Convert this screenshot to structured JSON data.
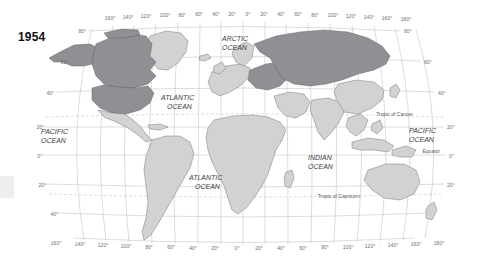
{
  "map": {
    "year": "1954",
    "projection": "robinson-world",
    "background_color": "#ffffff",
    "land_color": "#d2d2d2",
    "highlight_color": "#8f9094",
    "border_color": "#6e6e72",
    "graticule_color": "#b9b9bd",
    "longitude_ticks_top": [
      "160°",
      "140°",
      "120°",
      "100°",
      "80°",
      "60°",
      "40°",
      "20°",
      "0°",
      "20°",
      "40°",
      "60°",
      "80°",
      "100°",
      "120°",
      "140°",
      "160°",
      "180°"
    ],
    "longitude_ticks_bottom": [
      "160°",
      "140°",
      "120°",
      "100°",
      "80°",
      "60°",
      "40°",
      "20°",
      "0°",
      "20°",
      "40°",
      "60°",
      "80°",
      "100°",
      "120°",
      "140°",
      "160°",
      "180°"
    ],
    "latitude_ticks_left": [
      "80°",
      "60°",
      "40°",
      "20°",
      "0°",
      "20°",
      "40°"
    ],
    "latitude_ticks_right": [
      "80°",
      "60°",
      "40°",
      "20°",
      "0°",
      "20°"
    ],
    "ocean_labels": [
      {
        "name": "arctic-ocean",
        "line1": "ARCTIC",
        "line2": "OCEAN"
      },
      {
        "name": "north-atlantic-ocean",
        "line1": "ATLANTIC",
        "line2": "OCEAN"
      },
      {
        "name": "south-atlantic-ocean",
        "line1": "ATLANTIC",
        "line2": "OCEAN"
      },
      {
        "name": "east-pacific-ocean",
        "line1": "PACIFIC",
        "line2": "OCEAN"
      },
      {
        "name": "west-pacific-ocean",
        "line1": "PACIFIC",
        "line2": "OCEAN"
      },
      {
        "name": "indian-ocean",
        "line1": "INDIAN",
        "line2": "OCEAN"
      }
    ],
    "reference_lines": [
      {
        "name": "tropic-of-cancer",
        "label": "Tropic of Cancer"
      },
      {
        "name": "equator",
        "label": "Equator"
      },
      {
        "name": "tropic-of-capricorn",
        "label": "Tropic of Capricorn"
      }
    ]
  }
}
